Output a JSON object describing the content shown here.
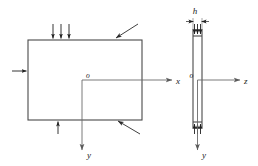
{
  "figure": {
    "colors": {
      "outline": "#4a4a4a",
      "axis": "#6b6b6b",
      "load_arrow": "#1f1f1f",
      "leader": "#2a2a2a",
      "background": "#ffffff",
      "text": "#1a1a1a"
    },
    "views": [
      {
        "id": "front-view",
        "name": "front view",
        "shape": "rectangle",
        "origin_label": "o",
        "axes": [
          {
            "name": "x-axis",
            "label": "x",
            "direction": "right"
          },
          {
            "name": "y-axis",
            "label": "y",
            "direction": "down"
          }
        ],
        "loads": [
          {
            "edge": "top",
            "label": "",
            "arrow_count": 3,
            "direction": "down"
          },
          {
            "edge": "left",
            "label": "",
            "arrow_count": 1,
            "direction": "right"
          },
          {
            "edge": "bottom",
            "label": "",
            "arrow_count": 1,
            "direction": "up"
          }
        ],
        "leaders": [
          {
            "name": "top-edge-leader",
            "edge": "top"
          },
          {
            "name": "bottom-edge-leader",
            "edge": "bottom"
          }
        ]
      },
      {
        "id": "edge-view",
        "name": "edge view",
        "shape": "thin rectangle",
        "origin_label": "o",
        "thickness_label": "h",
        "axes": [
          {
            "name": "z-axis",
            "label": "z",
            "direction": "right"
          },
          {
            "name": "y-axis",
            "label": "y",
            "direction": "down"
          }
        ],
        "loads": [
          {
            "edge": "top",
            "label": "",
            "arrow_count": 3,
            "direction": "down"
          },
          {
            "edge": "bottom",
            "label": "",
            "arrow_count": 3,
            "direction": "up"
          }
        ]
      }
    ],
    "labels": {
      "origin_left": "o",
      "origin_right": "o",
      "axis_x": "x",
      "axis_y_left": "y",
      "axis_z": "z",
      "axis_y_right": "y",
      "thickness": "h"
    }
  }
}
